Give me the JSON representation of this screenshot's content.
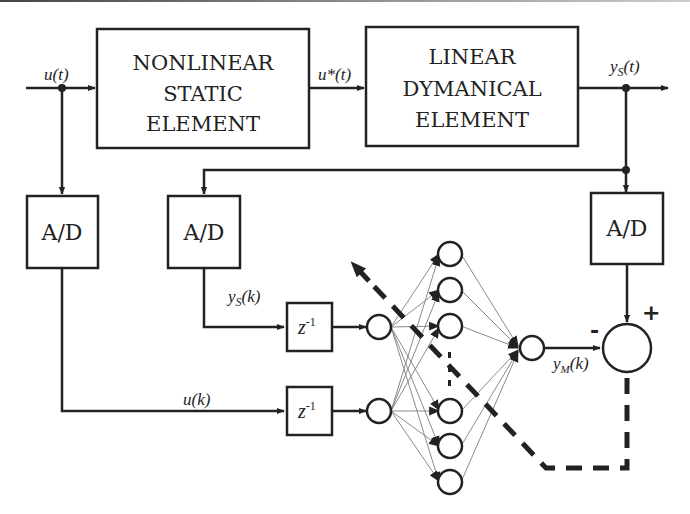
{
  "diagram": {
    "type": "neural network plant identification block diagram",
    "colors": {
      "line": "#222222",
      "thin_line": "#888888",
      "background": "#ffffff"
    },
    "blocks": {
      "nonlinear": {
        "lines": [
          "NONLINEAR",
          "STATIC",
          "ELEMENT"
        ]
      },
      "linear": {
        "lines": [
          "LINEAR",
          "DYMANICAL",
          "ELEMENT"
        ]
      },
      "ad_input": {
        "label": "A/D"
      },
      "ad_feedback": {
        "label": "A/D"
      },
      "ad_output": {
        "label": "A/D"
      },
      "delay_ys": {
        "label": "z",
        "exponent": "-1"
      },
      "delay_u": {
        "label": "z",
        "exponent": "-1"
      }
    },
    "signals": {
      "u_t": "u(t)",
      "u_star_t": "u*(t)",
      "ys_t": {
        "base": "y",
        "sub": "S",
        "arg": "(t)"
      },
      "ys_k": {
        "base": "y",
        "sub": "S",
        "arg": "(k)"
      },
      "u_k": "u(k)",
      "ym_k": {
        "base": "y",
        "sub": "M",
        "arg": "(k)"
      }
    },
    "summing_junction": {
      "plus": "+",
      "minus": "-"
    },
    "neural_network": {
      "input_neurons": 2,
      "hidden_neurons_shown": 6,
      "hidden_ellipsis": ":",
      "output_neurons": 1
    },
    "error_path": {
      "style": "dashed",
      "description": "error feedback adjusting network weights"
    }
  }
}
